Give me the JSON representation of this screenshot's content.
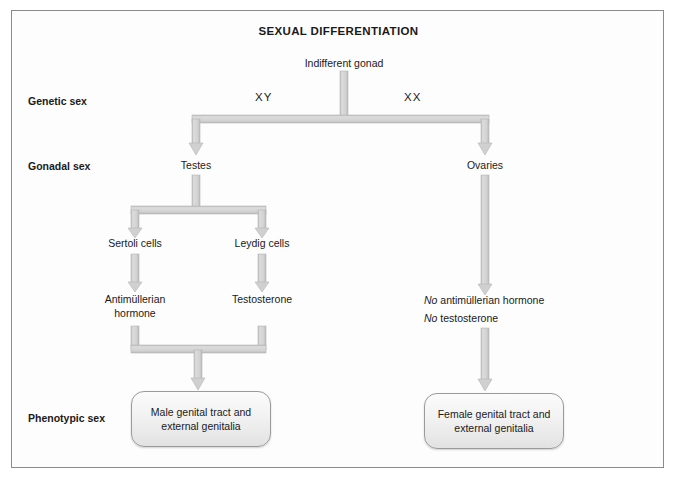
{
  "figure": {
    "title": "SEXUAL DIFFERENTIATION"
  },
  "stage_labels": [
    {
      "id": "genetic-sex",
      "text": "Genetic sex"
    },
    {
      "id": "gonadal-sex",
      "text": "Gonadal sex"
    },
    {
      "id": "phenotypic-sex",
      "text": "Phenotypic sex"
    }
  ],
  "nodes": {
    "root": "Indifferent gonad",
    "karyotype_male": "XY",
    "karyotype_female": "XX",
    "gonad_male": "Testes",
    "gonad_female": "Ovaries",
    "sertoli": "Sertoli cells",
    "leydig": "Leydig cells",
    "amh_line1": "Antimüllerian",
    "amh_line2": "hormone",
    "testosterone": "Testosterone",
    "no_amh_italic": "No",
    "no_amh_rest": " antimüllerian hormone",
    "no_testosterone_italic": "No",
    "no_testosterone_rest": " testosterone"
  },
  "outcomes": {
    "male": "Male genital tract and external genitalia",
    "female": "Female genital tract and external genitalia"
  },
  "colors": {
    "arrow_fill": "#d4d4d4",
    "arrow_edge": "#b4b4b4",
    "frame_border": "#8b8b8b",
    "text": "#1a1a1a",
    "box_fill": "#f0f0f0"
  }
}
